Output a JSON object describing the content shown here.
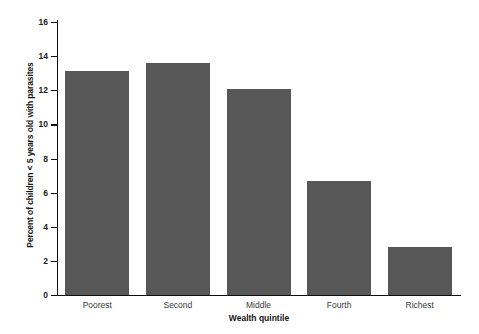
{
  "chart_data": {
    "type": "bar",
    "title": "",
    "subtitle": "",
    "xlabel": "Wealth quintile",
    "ylabel": "Percent of children < 5 years old with parasites",
    "categories": [
      "Poorest",
      "Second",
      "Middle",
      "Fourth",
      "Richest"
    ],
    "values": [
      13.1,
      13.6,
      12.1,
      6.7,
      2.8
    ],
    "ylim": [
      0,
      16
    ],
    "yticks": [
      0,
      2,
      4,
      6,
      8,
      10,
      12,
      14,
      16
    ],
    "ytick_labels": [
      "0",
      "2",
      "4",
      "6",
      "8",
      "10",
      "12",
      "14",
      "16"
    ],
    "grid": false,
    "legend": null,
    "bar_color": "#575757",
    "axis_color": "#0d0d0d",
    "background": "#ffffff"
  }
}
